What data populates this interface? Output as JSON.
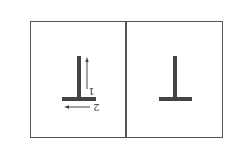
{
  "figure": {
    "panels": [
      {
        "id": "left",
        "shape": "inverted-T",
        "arrows": [
          {
            "label": "1",
            "direction": "up"
          },
          {
            "label": "2",
            "direction": "left"
          }
        ]
      },
      {
        "id": "right",
        "shape": "inverted-T",
        "arrows": []
      }
    ],
    "colors": {
      "stroke": "#444444",
      "border": "#555555"
    }
  },
  "labels": {
    "arrow1": "1",
    "arrow2": "2"
  }
}
